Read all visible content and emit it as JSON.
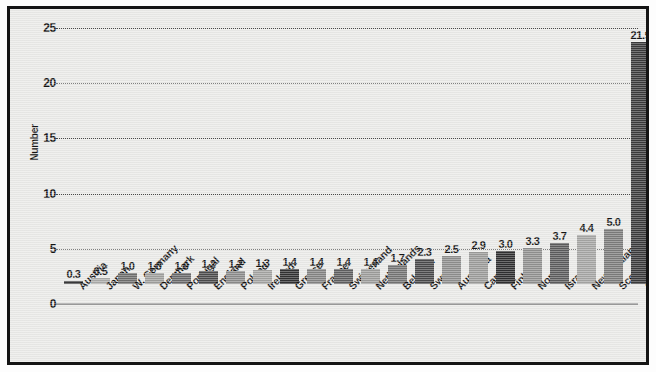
{
  "chart_data": {
    "type": "bar",
    "title": "",
    "subtitle": "",
    "xlabel": "",
    "ylabel": "Number",
    "ylim": [
      0,
      26.5
    ],
    "yticks": [
      0,
      5,
      10,
      15,
      20,
      25
    ],
    "ytick_labels": [
      "0",
      "5",
      "10",
      "15",
      "20",
      "25"
    ],
    "grid": "horizontal-dotted",
    "legend": "none",
    "label_rotation": -45,
    "categories": [
      "Austria",
      "Japan",
      "W. Germany",
      "Denmark",
      "Portugal",
      "England",
      "Poland",
      "Ireland",
      "Greece",
      "France",
      "Switzerland",
      "Netherlands",
      "Belgium",
      "Sweden",
      "Australia",
      "Canada",
      "Finland",
      "Norway",
      "Israel",
      "New Zealand",
      "Scotland",
      "United States"
    ],
    "values": [
      0.3,
      0.5,
      1.0,
      1.0,
      1.0,
      1.2,
      1.2,
      1.3,
      1.4,
      1.4,
      1.4,
      1.4,
      1.7,
      2.3,
      2.5,
      2.9,
      3.0,
      3.3,
      3.7,
      4.4,
      5.0,
      21.9
    ],
    "value_labels": [
      "0.3",
      "0.5",
      "1.0",
      "1.0",
      "1.0",
      "1.2",
      "1.2",
      "1.3",
      "1.4",
      "1.4",
      "1.4",
      "1.4",
      "1.7",
      "2.3",
      "2.5",
      "2.9",
      "3.0",
      "3.3",
      "3.7",
      "4.4",
      "5.0",
      "21.9"
    ],
    "bar_colors": [
      "#39393a",
      "#a9a9a7",
      "#6d6d6c",
      "#9d9d9b",
      "#69696a",
      "#4b4b4c",
      "#8a8a89",
      "#a2a2a0",
      "#313132",
      "#838382",
      "#5e5e5f",
      "#9b9b99",
      "#737372",
      "#49494a",
      "#8d8d8c",
      "#9a9a98",
      "#2f2f30",
      "#8f8f8e",
      "#5b5b5c",
      "#a4a4a2",
      "#7b7b7a",
      "#3a3a3b"
    ],
    "colors": {
      "figure_background": "#fdfdfd",
      "plot_background": "#e9e9e7",
      "frame_border": "#141414",
      "gridline": "#4a4a4a",
      "axis_line": "#9a9a9a",
      "text": "#131313"
    }
  }
}
